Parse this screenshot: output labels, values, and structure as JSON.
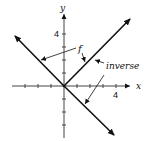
{
  "diagram": {
    "type": "function-graph",
    "axes": {
      "x_label": "x",
      "y_label": "y",
      "x_tick_label": "4",
      "y_tick_label": "4",
      "tick_spacing_units": 1,
      "x_range": [
        -4,
        5
      ],
      "y_range": [
        -4,
        6
      ]
    },
    "curves": [
      {
        "name": "f",
        "description": "y = |x| (V shape: left branch y=-x for x<0, right branch y=x for x>=0)"
      },
      {
        "name": "inverse",
        "description": "reflection of f across y=x: y=x for x>=0 and y=-x for x>=0"
      }
    ],
    "annotations": {
      "f_label": "f",
      "inverse_label": "inverse"
    },
    "colors": {
      "line": "#111111",
      "axis": "#555555",
      "background": "#ffffff"
    }
  }
}
